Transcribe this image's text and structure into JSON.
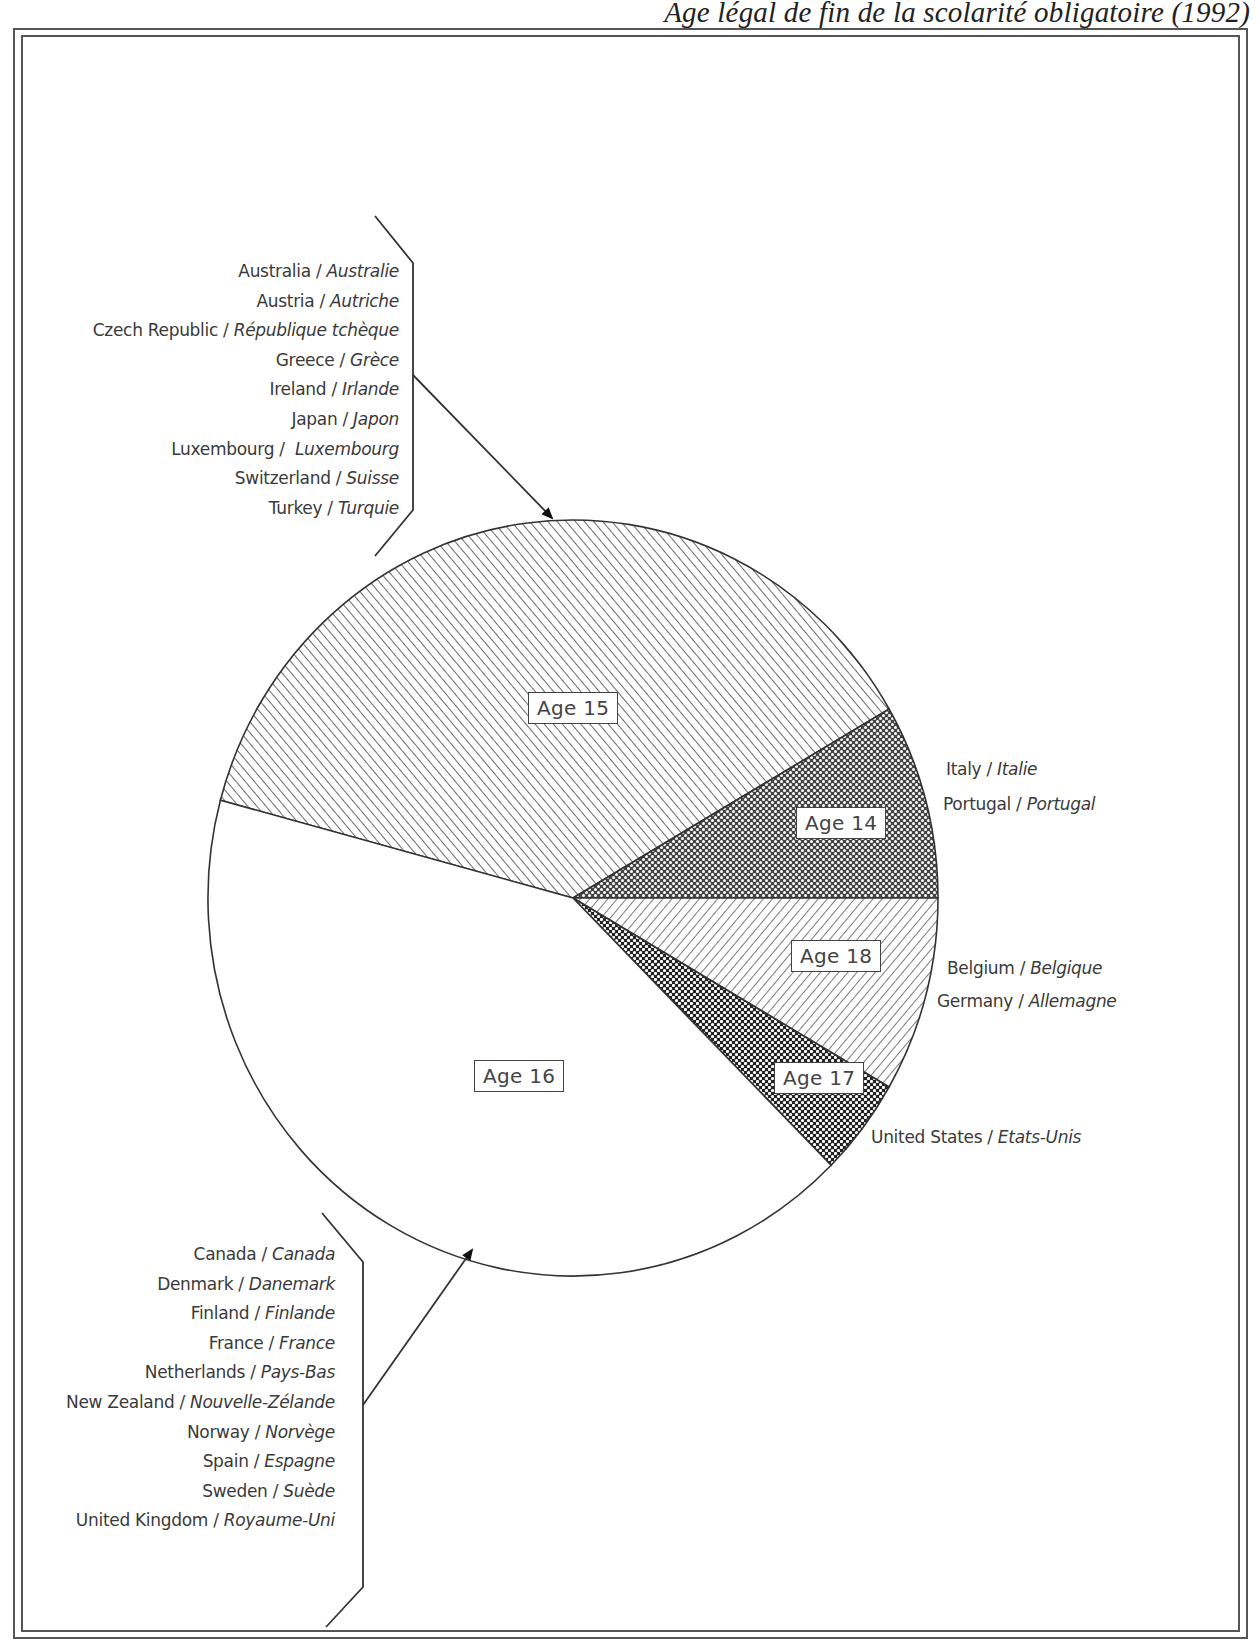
{
  "title": "Age légal de fin de la scolarité obligatoire (1992)",
  "chart_data": {
    "type": "pie",
    "title": "Age légal de fin de la scolarité obligatoire (1992)",
    "unit": "number of countries",
    "categories": [
      "Age 15",
      "Age 14",
      "Age 18",
      "Age 17",
      "Age 16"
    ],
    "values": [
      9,
      2,
      2,
      1,
      10
    ],
    "slices": [
      {
        "label": "Age 15",
        "count": 9,
        "pattern": "diagonal-hatch-forward",
        "countries": [
          {
            "en": "Australia",
            "fr": "Australie"
          },
          {
            "en": "Austria",
            "fr": "Autriche"
          },
          {
            "en": "Czech Republic",
            "fr": "République tchèque"
          },
          {
            "en": "Greece",
            "fr": "Grèce"
          },
          {
            "en": "Ireland",
            "fr": "Irlande"
          },
          {
            "en": "Japan",
            "fr": "Japon"
          },
          {
            "en": "Luxembourg",
            "fr": "Luxembourg"
          },
          {
            "en": "Switzerland",
            "fr": "Suisse"
          },
          {
            "en": "Turkey",
            "fr": "Turquie"
          }
        ]
      },
      {
        "label": "Age 14",
        "count": 2,
        "pattern": "dense-dots",
        "countries": [
          {
            "en": "Italy",
            "fr": "Italie"
          },
          {
            "en": "Portugal",
            "fr": "Portugal"
          }
        ]
      },
      {
        "label": "Age 18",
        "count": 2,
        "pattern": "diagonal-hatch-backward",
        "countries": [
          {
            "en": "Belgium",
            "fr": "Belgique"
          },
          {
            "en": "Germany",
            "fr": "Allemagne"
          }
        ]
      },
      {
        "label": "Age 17",
        "count": 1,
        "pattern": "dark-dots",
        "countries": [
          {
            "en": "United States",
            "fr": "Etats-Unis"
          }
        ]
      },
      {
        "label": "Age 16",
        "count": 10,
        "pattern": "none",
        "countries": [
          {
            "en": "Canada",
            "fr": "Canada"
          },
          {
            "en": "Denmark",
            "fr": "Danemark"
          },
          {
            "en": "Finland",
            "fr": "Finlande"
          },
          {
            "en": "France",
            "fr": "France"
          },
          {
            "en": "Netherlands",
            "fr": "Pays-Bas"
          },
          {
            "en": "New Zealand",
            "fr": "Nouvelle-Zélande"
          },
          {
            "en": "Norway",
            "fr": "Norvège"
          },
          {
            "en": "Spain",
            "fr": "Espagne"
          },
          {
            "en": "Sweden",
            "fr": "Suède"
          },
          {
            "en": "United Kingdom",
            "fr": "Royaume-Uni"
          }
        ]
      }
    ],
    "legend_position": "callouts around pie",
    "grid": false
  },
  "colors": {
    "line": "#333333",
    "text": "#3a3a3a",
    "background": "#ffffff"
  }
}
